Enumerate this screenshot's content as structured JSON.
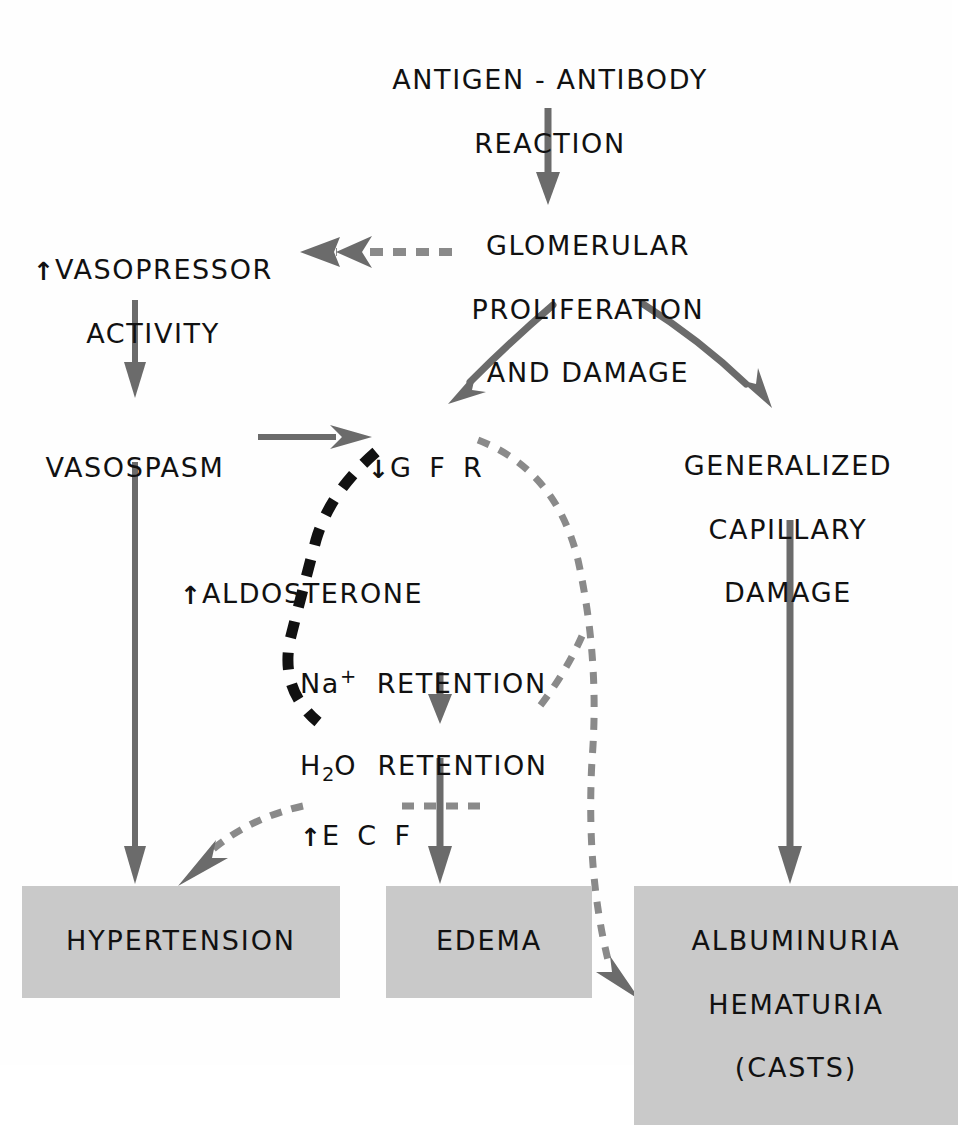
{
  "diagram": {
    "colors": {
      "arrow_solid": "#6b6b6b",
      "arrow_dashed_gray": "#8a8a8a",
      "arrow_dashed_black": "#111111",
      "box_fill": "#c9c9c9",
      "text": "#111111",
      "background": "#fefefe"
    },
    "nodes": [
      {
        "id": "antigen-antibody-reaction",
        "lines": [
          "ANTIGEN - ANTIBODY",
          "REACTION"
        ],
        "boxed": false
      },
      {
        "id": "glomerular-proliferation-and-damage",
        "lines": [
          "GLOMERULAR",
          "PROLIFERATION",
          "AND  DAMAGE"
        ],
        "boxed": false
      },
      {
        "id": "vasopressor-activity",
        "prefix_arrow": "up",
        "lines": [
          "VASOPRESSOR",
          "ACTIVITY"
        ],
        "boxed": false
      },
      {
        "id": "vasospasm",
        "lines": [
          "VASOSPASM"
        ],
        "boxed": false
      },
      {
        "id": "gfr",
        "prefix_arrow": "down",
        "lines": [
          "G F R"
        ],
        "boxed": false
      },
      {
        "id": "generalized-capillary-damage",
        "lines": [
          "GENERALIZED",
          "CAPILLARY",
          "DAMAGE"
        ],
        "boxed": false
      },
      {
        "id": "aldosterone",
        "prefix_arrow": "up",
        "lines": [
          "ALDOSTERONE"
        ],
        "boxed": false
      },
      {
        "id": "na-retention",
        "lines": [
          "Na+ RETENTION"
        ],
        "boxed": false
      },
      {
        "id": "h2o-retention",
        "lines": [
          "H2O RETENTION"
        ],
        "boxed": false
      },
      {
        "id": "ecf",
        "prefix_arrow": "up",
        "lines": [
          "E C F"
        ],
        "boxed": false
      },
      {
        "id": "hypertension",
        "lines": [
          "HYPERTENSION"
        ],
        "boxed": true
      },
      {
        "id": "edema",
        "lines": [
          "EDEMA"
        ],
        "boxed": true
      },
      {
        "id": "albuminuria-hematuria-casts",
        "lines": [
          "ALBUMINURIA",
          "HEMATURIA",
          "(CASTS)"
        ],
        "boxed": true
      }
    ],
    "labels": {
      "antigen_line1": "ANTIGEN - ANTIBODY",
      "antigen_line2": "REACTION",
      "glomerular_line1": "GLOMERULAR",
      "glomerular_line2": "PROLIFERATION",
      "glomerular_line3": "AND  DAMAGE",
      "vasopressor_line1": "VASOPRESSOR",
      "vasopressor_line2": "ACTIVITY",
      "vasospasm": "VASOSPASM",
      "gfr": "G F R",
      "capillary_line1": "GENERALIZED",
      "capillary_line2": "CAPILLARY",
      "capillary_line3": "DAMAGE",
      "aldosterone": "ALDOSTERONE",
      "na_symbol": "Na",
      "na_super": "+",
      "na_retention": "RETENTION",
      "h2o_symbol": "H",
      "h2o_sub": "2",
      "h2o_symbol2": "O",
      "h2o_retention": "RETENTION",
      "ecf": "E C F",
      "hypertension": "HYPERTENSION",
      "edema": "EDEMA",
      "albuminuria": "ALBUMINURIA",
      "hematuria": "HEMATURIA",
      "casts": "(CASTS)",
      "arrow_up": "↑",
      "arrow_down": "↓"
    },
    "edges": [
      {
        "id": "edge-antigen-to-glomerular",
        "from": "antigen-antibody-reaction",
        "to": "glomerular-proliferation-and-damage",
        "style": "solid",
        "color": "#6b6b6b"
      },
      {
        "id": "edge-glomerular-to-vasopressor",
        "from": "glomerular-proliferation-and-damage",
        "to": "vasopressor-activity",
        "style": "dashed",
        "color": "#8a8a8a"
      },
      {
        "id": "edge-glomerular-to-gfr",
        "from": "glomerular-proliferation-and-damage",
        "to": "gfr",
        "style": "solid-curved",
        "color": "#6b6b6b"
      },
      {
        "id": "edge-glomerular-to-capillary",
        "from": "glomerular-proliferation-and-damage",
        "to": "generalized-capillary-damage",
        "style": "solid-curved",
        "color": "#6b6b6b"
      },
      {
        "id": "edge-vasopressor-to-vasospasm",
        "from": "vasopressor-activity",
        "to": "vasospasm",
        "style": "solid",
        "color": "#6b6b6b"
      },
      {
        "id": "edge-vasospasm-to-gfr",
        "from": "vasospasm",
        "to": "gfr",
        "style": "solid",
        "color": "#6b6b6b"
      },
      {
        "id": "edge-vasospasm-to-hypertension",
        "from": "vasospasm",
        "to": "hypertension",
        "style": "solid",
        "color": "#6b6b6b"
      },
      {
        "id": "edge-gfr-to-aldosterone-h2o",
        "from": "gfr",
        "to": "h2o-retention",
        "style": "dashed-thick",
        "color": "#111111"
      },
      {
        "id": "edge-gfr-to-albuminuria",
        "from": "gfr",
        "to": "albuminuria-hematuria-casts",
        "style": "dashed",
        "color": "#8a8a8a"
      },
      {
        "id": "edge-gfr-to-h2o-branch",
        "from": "gfr",
        "to": "h2o-retention",
        "style": "dashed",
        "color": "#8a8a8a"
      },
      {
        "id": "edge-na-to-h2o",
        "from": "na-retention",
        "to": "h2o-retention",
        "style": "solid",
        "color": "#6b6b6b"
      },
      {
        "id": "edge-h2o-to-edema",
        "from": "h2o-retention",
        "to": "edema",
        "style": "solid",
        "color": "#6b6b6b"
      },
      {
        "id": "edge-h2o-to-ecf",
        "from": "h2o-retention",
        "to": "ecf",
        "style": "dashed",
        "color": "#8a8a8a"
      },
      {
        "id": "edge-ecf-to-hypertension",
        "from": "ecf",
        "to": "hypertension",
        "style": "dashed",
        "color": "#8a8a8a"
      },
      {
        "id": "edge-capillary-to-albuminuria",
        "from": "generalized-capillary-damage",
        "to": "albuminuria-hematuria-casts",
        "style": "solid",
        "color": "#6b6b6b"
      }
    ]
  }
}
